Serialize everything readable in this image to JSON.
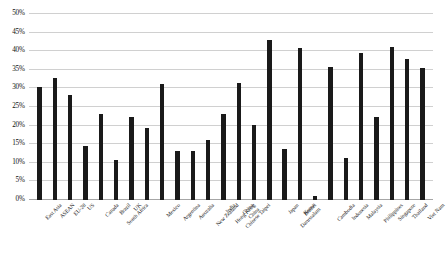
{
  "chart_data": {
    "type": "bar",
    "title": "",
    "subtitle": "",
    "xlabel": "",
    "ylabel": "",
    "ylim": [
      0,
      50
    ],
    "ytick_values": [
      0,
      5,
      10,
      15,
      20,
      25,
      30,
      35,
      40,
      45,
      50
    ],
    "ytick_labels": [
      "0%",
      "5%",
      "10%",
      "15%",
      "20%",
      "25%",
      "30%",
      "35%",
      "40%",
      "45%",
      "50%"
    ],
    "grid": true,
    "legend": "none",
    "bar_color": "#1a1a1a",
    "categories": [
      "East Asia",
      "ASEAN",
      "EU-28",
      "US",
      "Canada",
      "Brazil",
      "UK",
      "South Africa",
      "Mexico",
      "Argentina",
      "Australia",
      "New Zealand",
      "India",
      "China",
      "Hong Kong China",
      "Chinese Taipei",
      "Japan",
      "Korea",
      "Brunei Darussalam",
      "Cambodia",
      "Indonesia",
      "Malaysia",
      "Philippines",
      "Singapore",
      "Thailand",
      "Viet Nam"
    ],
    "values": [
      30.5,
      32.7,
      28.2,
      14.6,
      23.2,
      10.8,
      22.3,
      19.3,
      31.2,
      13.3,
      13.2,
      16.2,
      23.2,
      31.4,
      20.1,
      43.0,
      13.7,
      40.9,
      1.2,
      35.8,
      11.2,
      39.6,
      22.2,
      41.1,
      38.0,
      35.6
    ]
  }
}
